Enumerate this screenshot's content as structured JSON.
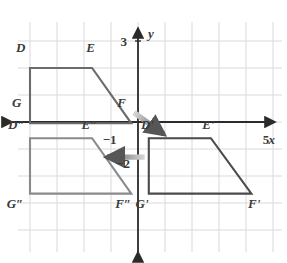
{
  "figure": {
    "grid": {
      "spacing_px": 27,
      "origin_px": {
        "x": 138,
        "y": 122
      },
      "color": "#d9d9e0",
      "x_range": [
        -5,
        5.5
      ],
      "y_range": [
        -5,
        5
      ],
      "show": true
    },
    "axes": {
      "color": "#2b2b2b",
      "x_axis_label": "x",
      "y_axis_label": "y",
      "x_tick_labels": [
        {
          "text": "−1",
          "value": -1
        },
        {
          "text": "5",
          "value": 5
        }
      ],
      "y_tick_labels": [
        {
          "text": "3",
          "value": 3
        },
        {
          "text": "−2",
          "value": -2
        }
      ]
    },
    "shapes": [
      {
        "name": "trapezoid-DEFG",
        "stroke": "#6b6b6b",
        "vertices": [
          {
            "label": "D",
            "x": -4,
            "y": 2
          },
          {
            "label": "E",
            "x": -1.7,
            "y": 2
          },
          {
            "label": "F",
            "x": -0.25,
            "y": -0.05
          },
          {
            "label": "G",
            "x": -4,
            "y": -0.05
          }
        ],
        "labels": [
          {
            "text": "D",
            "x": -4.35,
            "y": 2.75
          },
          {
            "text": "E",
            "x": -1.75,
            "y": 2.75
          },
          {
            "text": "F",
            "x": -0.6,
            "y": 0.72
          },
          {
            "text": "G",
            "x": -4.5,
            "y": 0.72
          }
        ]
      },
      {
        "name": "trapezoid-D-prime-E-prime-F-prime-G-prime",
        "stroke": "#4a4a4a",
        "vertices": [
          {
            "label": "D'",
            "x": 0.4,
            "y": -0.6
          },
          {
            "label": "E'",
            "x": 2.7,
            "y": -0.6
          },
          {
            "label": "F'",
            "x": 4.2,
            "y": -2.65
          },
          {
            "label": "G'",
            "x": 0.4,
            "y": -2.65
          }
        ],
        "labels": [
          {
            "text": "D'",
            "x": 0.35,
            "y": -0.1
          },
          {
            "text": "E'",
            "x": 2.6,
            "y": -0.1
          },
          {
            "text": "F'",
            "x": 4.3,
            "y": -3.0
          },
          {
            "text": "G'",
            "x": 0.15,
            "y": -3.0
          }
        ]
      },
      {
        "name": "trapezoid-D-double-prime-E-double-prime-F-double-prime-G-double-prime",
        "stroke": "#8a8a8a",
        "vertices": [
          {
            "label": "D''",
            "x": -4,
            "y": -0.6
          },
          {
            "label": "E''",
            "x": -1.7,
            "y": -0.6
          },
          {
            "label": "F''",
            "x": -0.25,
            "y": -2.65
          },
          {
            "label": "G''",
            "x": -4,
            "y": -2.65
          }
        ],
        "labels": [
          {
            "text": "D″",
            "x": -4.5,
            "y": -0.1
          },
          {
            "text": "E″",
            "x": -1.8,
            "y": -0.1
          },
          {
            "text": "F″",
            "x": -0.55,
            "y": -3.0
          },
          {
            "text": "G″",
            "x": -4.55,
            "y": -3.0
          }
        ]
      }
    ],
    "arrows": [
      {
        "name": "translation-arrow-1",
        "direction": "down-right",
        "from": {
          "x": -0.15,
          "y": 0.35
        },
        "to": {
          "x": 0.95,
          "y": -0.45
        },
        "color": "#6f6f6f"
      },
      {
        "name": "translation-arrow-2",
        "direction": "left",
        "from": {
          "x": 0.25,
          "y": -1.3
        },
        "to": {
          "x": -1.15,
          "y": -1.3
        },
        "color": "#6f6f6f"
      }
    ]
  }
}
